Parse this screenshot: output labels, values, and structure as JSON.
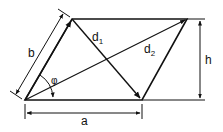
{
  "diagram": {
    "labels": {
      "a": "a",
      "b": "b",
      "h": "h",
      "d1": "d",
      "d1_sub": "1",
      "d2": "d",
      "d2_sub": "2",
      "phi": "φ"
    },
    "colors": {
      "stroke": "#111111",
      "background": "#ffffff"
    }
  }
}
